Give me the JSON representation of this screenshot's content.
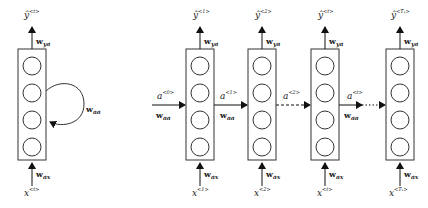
{
  "folded": {
    "output_label": "ŷ",
    "output_sup": "<t>",
    "input_label": "x",
    "input_sup": "<t>",
    "w_ya": "w",
    "w_ya_sub": "ya",
    "w_ax": "w",
    "w_ax_sub": "ax",
    "w_aa": "w",
    "w_aa_sub": "aa"
  },
  "unrolled": {
    "initial_state": {
      "label": "a",
      "sup": "<0>",
      "w": "w",
      "w_sub": "aa"
    },
    "cells": [
      {
        "output_label": "ŷ",
        "output_sup": "<1>",
        "input_label": "x",
        "input_sup": "<1>",
        "w_ya": "w",
        "w_ya_sub": "ya",
        "w_ax": "w",
        "w_ax_sub": "ax"
      },
      {
        "output_label": "ŷ",
        "output_sup": "<2>",
        "input_label": "x",
        "input_sup": "<2>",
        "w_ya": "w",
        "w_ya_sub": "ya",
        "w_ax": "w",
        "w_ax_sub": "ax"
      },
      {
        "output_label": "ŷ",
        "output_sup": "<t>",
        "input_label": "x",
        "input_sup": "<t>",
        "w_ya": "w",
        "w_ya_sub": "ya",
        "w_ax": "w",
        "w_ax_sub": "ax"
      },
      {
        "output_label": "ŷ",
        "output_sup": "<Tᵧ>",
        "input_label": "x",
        "input_sup": "<Tₓ>",
        "w_ya": "w",
        "w_ya_sub": "ya",
        "w_ax": "w",
        "w_ax_sub": "ax"
      }
    ],
    "transitions": [
      {
        "label": "a",
        "sup": "<1>",
        "w": "w",
        "w_sub": "aa",
        "style": "solid"
      },
      {
        "label": "a",
        "sup": "<2>",
        "w": "",
        "w_sub": "",
        "style": "dashed"
      },
      {
        "label": "a",
        "sup": "<t>",
        "w": "w",
        "w_sub": "aa",
        "style": "dotted"
      }
    ]
  }
}
